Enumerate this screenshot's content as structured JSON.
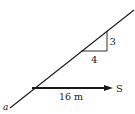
{
  "diagram": {
    "slope_labels": {
      "rise": "3",
      "run": "4"
    },
    "displacement_label": "16 m",
    "force_label": "S",
    "point_label": "a",
    "colors": {
      "line": "#1a1a1a",
      "background": "#ffffff"
    }
  }
}
